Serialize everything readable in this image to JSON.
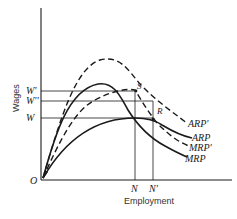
{
  "diagram": {
    "type": "economics-curve-diagram",
    "axes": {
      "y_label": "Wages",
      "x_label": "Employment",
      "origin_label": "O"
    },
    "y_ticks": [
      {
        "label": "W'",
        "y": 91
      },
      {
        "label": "W''",
        "y": 101
      },
      {
        "label": "W",
        "y": 118
      }
    ],
    "x_ticks": [
      {
        "label": "N",
        "x": 135
      },
      {
        "label": "N'",
        "x": 153
      }
    ],
    "points": [
      {
        "label": "S"
      },
      {
        "label": "R"
      }
    ],
    "curves": [
      {
        "name": "ARP'",
        "style": "dashed"
      },
      {
        "name": "ARP",
        "style": "solid"
      },
      {
        "name": "MRP'",
        "style": "dashed"
      },
      {
        "name": "MRP",
        "style": "solid"
      }
    ],
    "colors": {
      "line": "#1a1a1a",
      "background": "#ffffff"
    }
  }
}
